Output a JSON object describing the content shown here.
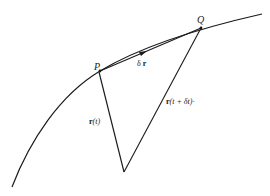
{
  "diagram": {
    "points": {
      "P": "P",
      "Q": "Q"
    },
    "labels": {
      "delta_r_symbol": "δ",
      "delta_r_vec": "r",
      "r_t_vec": "r",
      "r_t_arg": "(t)",
      "r_t_dt_vec": "r",
      "r_t_dt_arg": "(t + δt)·"
    },
    "colors": {
      "ink": "#1a1a1a",
      "background": "#ffffff"
    }
  }
}
